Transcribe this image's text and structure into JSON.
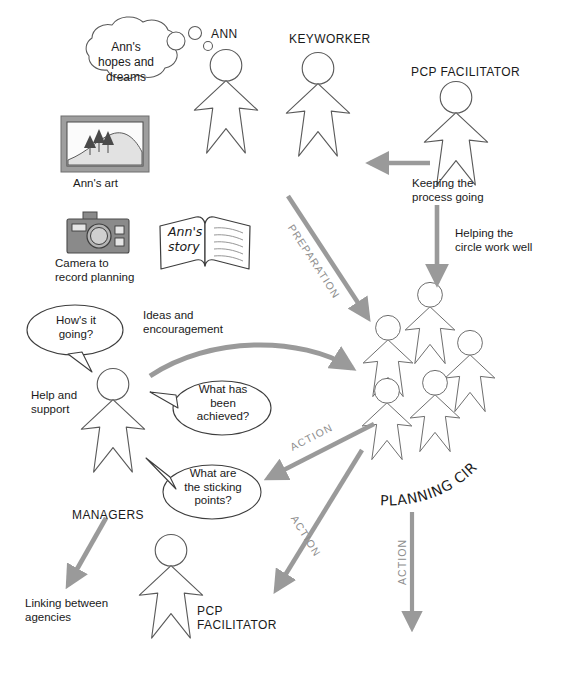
{
  "diagram": {
    "colors": {
      "ink": "#1a1a1a",
      "outline": "#5a5a5a",
      "arrow_gray": "#9a9a9a",
      "arrow_gray_dark": "#8d8d8d",
      "frame_gray": "#9e9e9e",
      "frame_inner": "#f2f2f2",
      "camera_body": "#8a8a8a",
      "tree_dark": "#4a4a4a",
      "hill_fill": "#e2e2e2",
      "white": "#ffffff"
    },
    "people": [
      {
        "id": "ann",
        "label": "ANN"
      },
      {
        "id": "keyworker",
        "label": "KEYWORKER"
      },
      {
        "id": "pcp-facilitator-top",
        "label": "PCP FACILITATOR"
      },
      {
        "id": "managers",
        "label": "MANAGERS"
      },
      {
        "id": "pcp-facilitator-bottom",
        "label": "PCP\nFACILITATOR"
      }
    ],
    "group": {
      "id": "planning-circle",
      "label": "PLANNING CIRCLE",
      "figure_count": 5
    },
    "artifacts": [
      {
        "id": "anns-art",
        "caption": "Ann's art",
        "icon": "picture-frame-icon"
      },
      {
        "id": "camera",
        "caption": "Camera to\nrecord planning",
        "icon": "camera-icon"
      },
      {
        "id": "anns-story",
        "caption": "Ann's\nstory",
        "icon": "open-book-icon"
      }
    ],
    "thought_cloud": {
      "id": "anns-hopes",
      "text": "Ann's\nhopes and\ndreams"
    },
    "speech_bubbles": [
      {
        "id": "hows-it-going",
        "text": "How's it\ngoing?"
      },
      {
        "id": "what-has-been-achieved",
        "text": "What has\nbeen\nachieved?"
      },
      {
        "id": "what-are-the-sticking-points",
        "text": "What are\nthe sticking\npoints?"
      }
    ],
    "flow_labels": [
      {
        "id": "keeping-the-process-going",
        "text": "Keeping the\nprocess going"
      },
      {
        "id": "helping-the-circle-work-well",
        "text": "Helping the\ncircle work well"
      },
      {
        "id": "ideas-and-encouragement",
        "text": "Ideas and\nencouragement"
      },
      {
        "id": "help-and-support",
        "text": "Help and\nsupport"
      },
      {
        "id": "linking-between-agencies",
        "text": "Linking between\nagencies"
      }
    ],
    "stage_labels": [
      {
        "id": "preparation",
        "text": "PREPARATION"
      },
      {
        "id": "action-left",
        "text": "ACTION"
      },
      {
        "id": "action-mid",
        "text": "ACTION"
      },
      {
        "id": "action-right",
        "text": "ACTION"
      }
    ]
  }
}
